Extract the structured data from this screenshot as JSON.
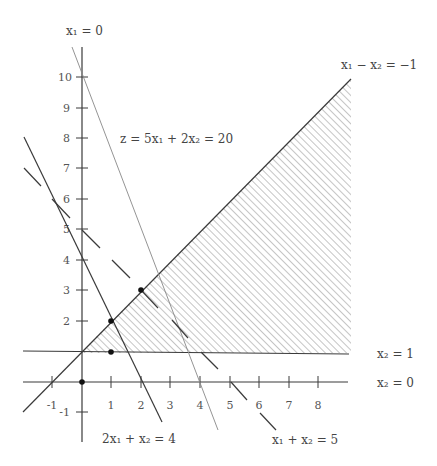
{
  "diagram": {
    "type": "linear-programming-feasible-region",
    "axes": {
      "x_axis_label": "x₂ = 0",
      "y_axis_label": "x₁ = 0",
      "x_ticks": [
        "-1",
        "1",
        "2",
        "3",
        "4",
        "5",
        "6",
        "7",
        "8"
      ],
      "y_ticks": [
        "-1",
        "2",
        "3",
        "4",
        "5",
        "6",
        "7",
        "8",
        "9",
        "10"
      ]
    },
    "constraints": [
      {
        "id": "c1",
        "label": "x₁ − x₂ = −1"
      },
      {
        "id": "c2",
        "label": "x₂ = 1"
      },
      {
        "id": "c3",
        "label": "2x₁ + x₂ = 4"
      },
      {
        "id": "c4",
        "label": "x₁ + x₂ = 5",
        "style": "dashed"
      }
    ],
    "objective": {
      "label": "z = 5x₁ + 2x₂ = 20"
    },
    "points": [
      {
        "x1": 0,
        "x2": 0
      },
      {
        "x1": 1,
        "x2": 1
      },
      {
        "x1": 1,
        "x2": 2
      },
      {
        "x1": 2,
        "x2": 3
      }
    ],
    "feasible_region": {
      "hatched": true,
      "bounds": "x₂ ≥ 1, x₁ − x₂ ≥ −1"
    },
    "colors": {
      "line": "#3a3a3a",
      "hatch": "#777777",
      "objective": "#777777",
      "background": "#ffffff"
    }
  }
}
